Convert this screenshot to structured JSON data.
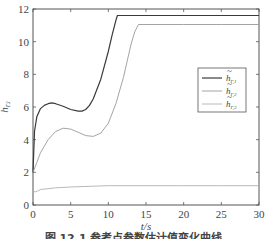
{
  "chart_data": {
    "type": "line",
    "title": "",
    "xlabel": "t/s",
    "ylabel": "h_Γ,i",
    "xlim": [
      0,
      30
    ],
    "ylim": [
      0,
      12
    ],
    "xticks": [
      0,
      5,
      10,
      15,
      20,
      25,
      30
    ],
    "yticks": [
      0,
      2,
      4,
      6,
      8,
      10,
      12
    ],
    "grid": false,
    "legend_position": "right-middle",
    "series": [
      {
        "name": "h̃_Γ,1",
        "color": "#3a3a3a",
        "x": [
          0,
          0.2,
          0.5,
          1,
          1.5,
          2,
          2.5,
          3,
          4,
          5,
          6,
          6.5,
          7,
          7.5,
          8,
          9,
          10,
          10.5,
          11,
          11.2,
          15,
          20,
          25,
          30
        ],
        "y": [
          2.0,
          4.5,
          5.4,
          5.9,
          6.1,
          6.2,
          6.25,
          6.2,
          6.05,
          5.85,
          5.75,
          5.75,
          5.85,
          6.1,
          6.5,
          7.7,
          9.4,
          10.4,
          11.3,
          11.6,
          11.6,
          11.6,
          11.6,
          11.6
        ]
      },
      {
        "name": "h̃_Γ,2",
        "color": "#9a9a9a",
        "x": [
          0,
          0.5,
          1,
          2,
          3,
          4,
          5,
          6,
          7,
          8,
          9,
          10,
          11,
          12,
          13,
          13.5,
          14,
          15,
          20,
          25,
          30
        ],
        "y": [
          2.0,
          2.6,
          3.2,
          4.0,
          4.5,
          4.7,
          4.65,
          4.45,
          4.25,
          4.2,
          4.4,
          5.0,
          6.2,
          7.8,
          9.8,
          10.6,
          11.05,
          11.05,
          11.05,
          11.05,
          11.05
        ]
      },
      {
        "name": "h̃_Γ,3",
        "color": "#b0b0b0",
        "x": [
          0,
          0.3,
          0.6,
          1,
          2,
          3,
          5,
          8,
          10,
          15,
          20,
          25,
          30
        ],
        "y": [
          0.85,
          0.8,
          0.85,
          0.95,
          1.0,
          1.05,
          1.1,
          1.15,
          1.18,
          1.18,
          1.18,
          1.18,
          1.18
        ]
      }
    ]
  },
  "legend": {
    "items": [
      {
        "base": "h",
        "sub": "Γ,1"
      },
      {
        "base": "h",
        "sub": "Γ,2"
      },
      {
        "base": "h",
        "sub": "Γ,3"
      }
    ]
  },
  "caption": "图 12.1  参考点参数估计值变化曲线"
}
